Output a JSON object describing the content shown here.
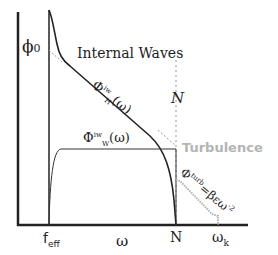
{
  "diagram": {
    "labels": {
      "phi0": "ϕ",
      "phi0_sub": "0",
      "internal_waves": "Internal Waves",
      "phi_h": "Φ",
      "phi_h_sup": "iw",
      "phi_h_sub": "H",
      "phi_h_arg": "(ω)",
      "N_italic": "N",
      "turbulence": "Turbulence",
      "phi_w": "Φ",
      "phi_w_sup": "iw",
      "phi_w_sub": "W",
      "phi_w_arg": "(ω)",
      "phi_turb": "Φ",
      "phi_turb_sup": "turb",
      "phi_turb_eq": "=βεω",
      "phi_turb_exp": "-2",
      "f_eff": "f",
      "f_eff_sub": "eff",
      "omega": "ω",
      "N_axis": "N",
      "omega_k": "ω",
      "omega_k_sub": "k"
    },
    "colors": {
      "ink": "#222222",
      "turbulence_grey": "#b4b4b4",
      "dashed": "#999999"
    }
  }
}
